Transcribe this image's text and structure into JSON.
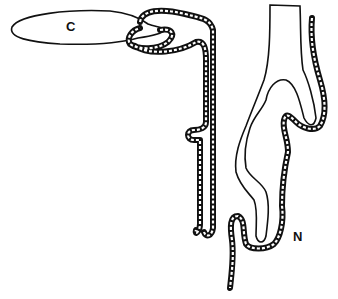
{
  "labels": {
    "c": "C",
    "n": "N"
  },
  "colors": {
    "line": "#111111",
    "background": "#ffffff",
    "stipple": "#222222"
  }
}
